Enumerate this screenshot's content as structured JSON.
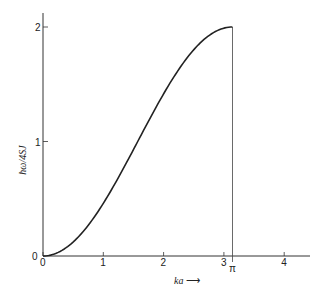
{
  "chart_data": {
    "type": "line",
    "title": "",
    "xlabel": "ka",
    "ylabel": "ħω/4SJ",
    "xlim": [
      0,
      4.3
    ],
    "ylim": [
      0,
      2.1
    ],
    "x_ticks": [
      "0",
      "1",
      "2",
      "3",
      "4"
    ],
    "x_special_tick": "π",
    "y_ticks": [
      "0",
      "1",
      "2"
    ],
    "grid": false,
    "series": [
      {
        "name": "ħω/4SJ = 1 − cos(ka)",
        "x": [
          0,
          0.25,
          0.5,
          0.75,
          1.0,
          1.25,
          1.5,
          1.75,
          2.0,
          2.25,
          2.5,
          2.75,
          3.0,
          3.1416
        ],
        "y": [
          0,
          0.03,
          0.12,
          0.27,
          0.46,
          0.68,
          0.93,
          1.18,
          1.42,
          1.63,
          1.8,
          1.92,
          1.99,
          2.0
        ]
      }
    ],
    "annotations": [
      "vertical line at ka = π"
    ]
  },
  "labels": {
    "ylabel": "ħω/4SJ",
    "xlabel": "ka",
    "xarrow": "⟶",
    "origin_y": "0",
    "origin_x": "0",
    "pi": "π"
  }
}
